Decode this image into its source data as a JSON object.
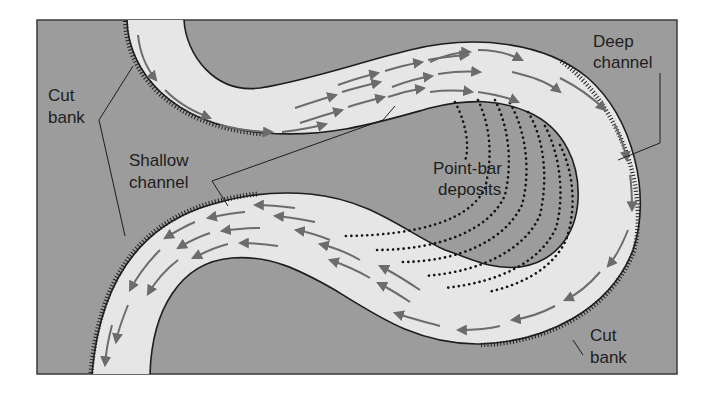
{
  "diagram": {
    "colors": {
      "background": "#ffffff",
      "floodplain": "#9c9c9c",
      "river": "#e6e6e6",
      "bank_line": "#1e1e1e",
      "flow_arrow": "#6c6c6c",
      "deposit_dots": "#141414",
      "label_text": "#1e1e1e"
    },
    "labels": {
      "cut_bank_upper": [
        "Cut",
        "bank"
      ],
      "shallow_channel": [
        "Shallow",
        "channel"
      ],
      "deep_channel": [
        "Deep",
        "channel"
      ],
      "point_bar_deposits": [
        "Point-bar",
        "deposits"
      ],
      "cut_bank_lower": [
        "Cut",
        "bank"
      ]
    }
  }
}
